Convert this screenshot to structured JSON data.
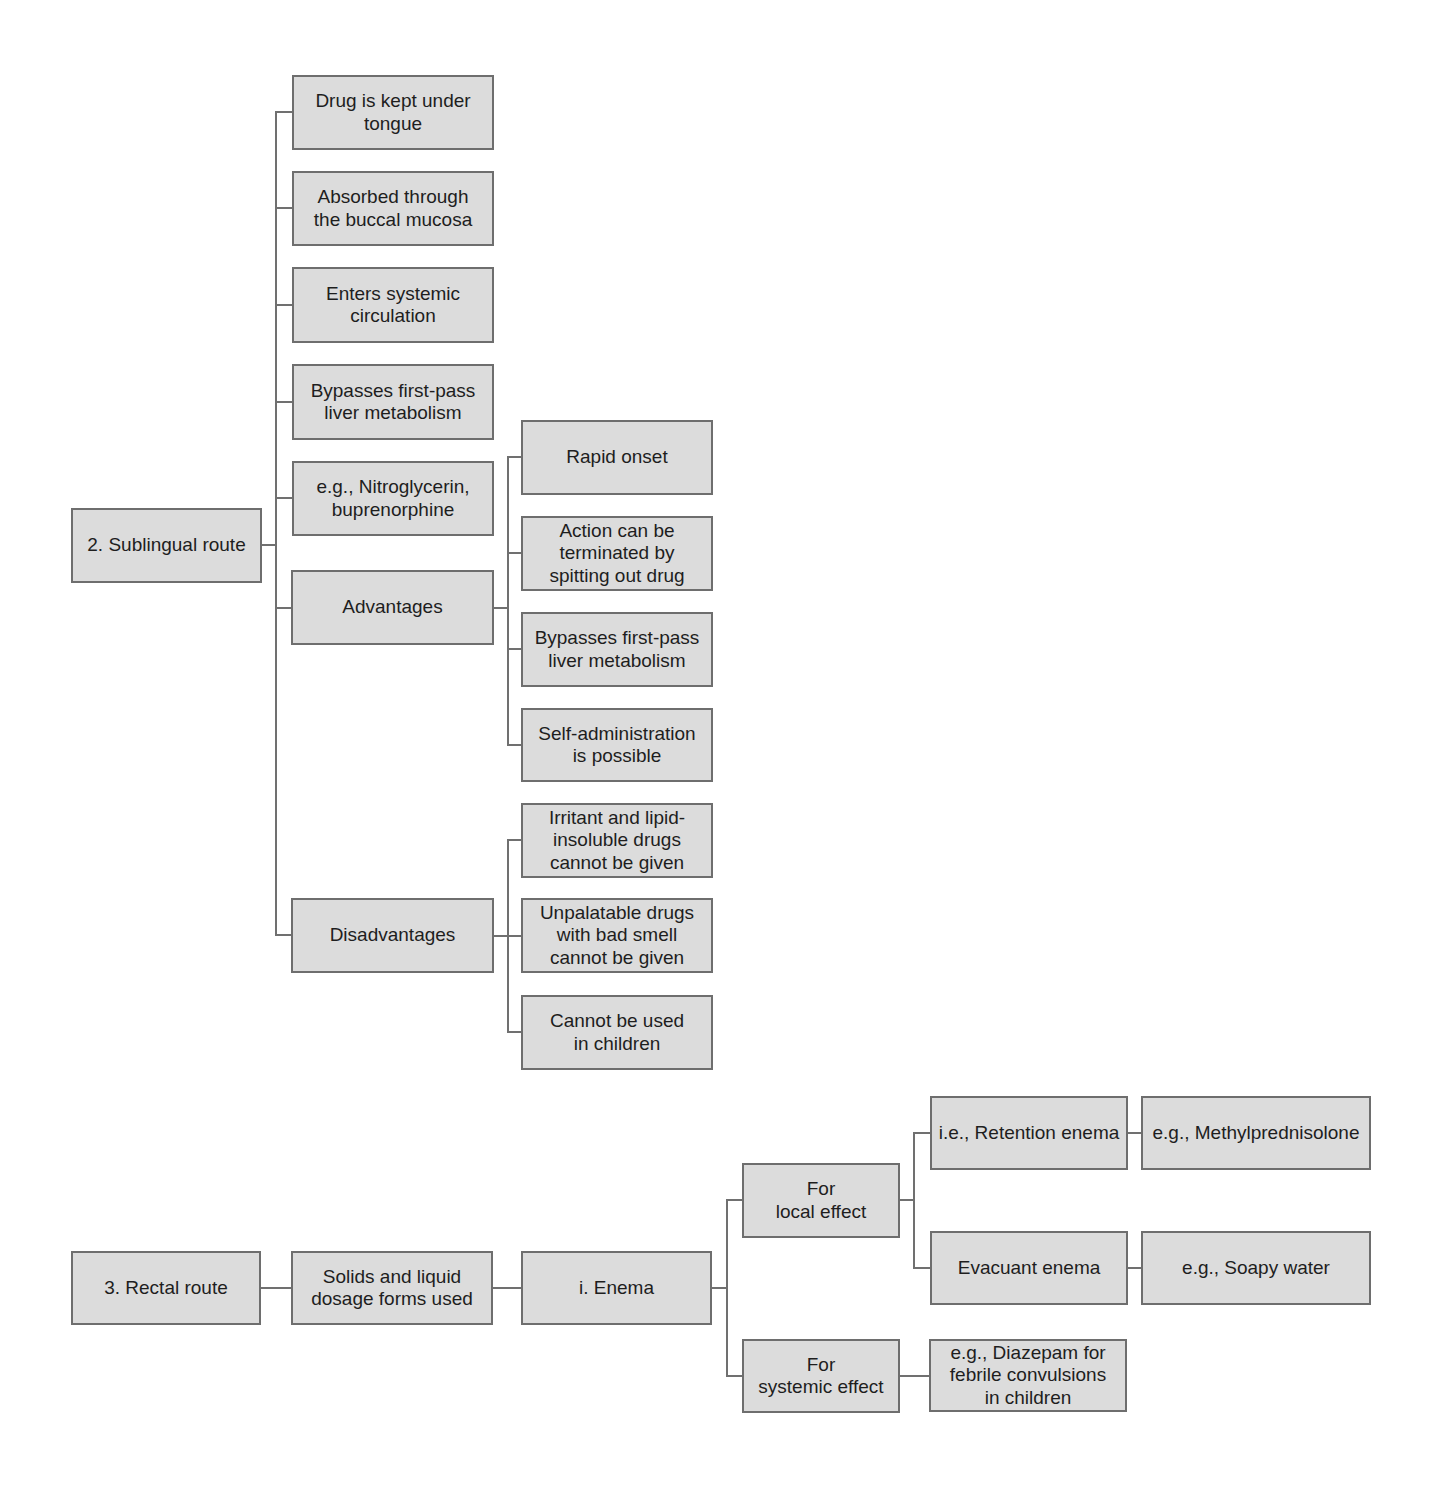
{
  "sublingual": {
    "root": "2. Sublingual route",
    "children": [
      "Drug is kept under\ntongue",
      "Absorbed through\nthe buccal mucosa",
      "Enters systemic\ncirculation",
      "Bypasses first-pass\nliver metabolism",
      "e.g., Nitroglycerin,\nbuprenorphine",
      "Advantages",
      "Disadvantages"
    ],
    "advantages": [
      "Rapid onset",
      "Action can be\nterminated by\nspitting out drug",
      "Bypasses first-pass\nliver metabolism",
      "Self-administration\nis possible"
    ],
    "disadvantages": [
      "Irritant and lipid-\ninsoluble drugs\ncannot be given",
      "Unpalatable drugs\nwith bad smell\ncannot be given",
      "Cannot be used\nin children"
    ]
  },
  "rectal": {
    "root": "3. Rectal route",
    "forms": "Solids and liquid\ndosage forms used",
    "enema": "i. Enema",
    "local_effect": "For\nlocal effect",
    "systemic_effect": "For\nsystemic effect",
    "retention": "i.e., Retention enema",
    "retention_example": "e.g., Methylprednisolone",
    "evacuant": "Evacuant enema",
    "evacuant_example": "e.g., Soapy water",
    "systemic_example": "e.g., Diazepam for\nfebrile convulsions\nin children"
  },
  "colors": {
    "box_fill": "#dcdcdc",
    "box_border": "#6e6e6e",
    "connector": "#707070",
    "text": "#1e1e1e"
  }
}
